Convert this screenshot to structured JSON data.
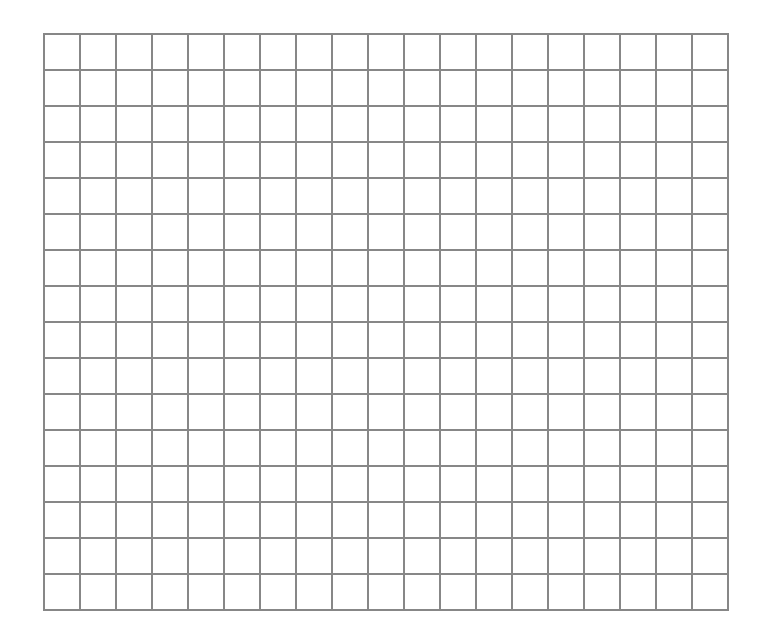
{
  "document": {
    "kind": "grid-paper-sheet",
    "title": "Blank Grid Sheet",
    "caption": "",
    "background_color": "#ffffff",
    "text_content": ""
  },
  "grid": {
    "columns": 19,
    "rows": 16,
    "cell_width_px": 36,
    "cell_height_px": 36,
    "line_color": "#808080",
    "line_width_px": 2,
    "origin_x_px": 43,
    "origin_y_px": 33,
    "width_px": 685,
    "height_px": 575,
    "border_color": "#808080",
    "fill_color": "#ffffff",
    "labels": [],
    "annotations": [],
    "cell_values": []
  },
  "page": {
    "width_px": 770,
    "height_px": 642,
    "margin_left_px": 43,
    "margin_top_px": 33,
    "margin_right_px": 42,
    "margin_bottom_px": 34
  }
}
